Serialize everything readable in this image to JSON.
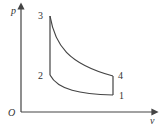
{
  "diagram": {
    "type": "p-v cycle diagram",
    "axes": {
      "y_label": "p",
      "x_label": "v",
      "origin_label": "O"
    },
    "points": [
      {
        "id": "1",
        "label": "1"
      },
      {
        "id": "2",
        "label": "2"
      },
      {
        "id": "3",
        "label": "3"
      },
      {
        "id": "4",
        "label": "4"
      }
    ],
    "processes": [
      {
        "from": "1",
        "to": "2",
        "kind": "curve"
      },
      {
        "from": "2",
        "to": "3",
        "kind": "vertical"
      },
      {
        "from": "3",
        "to": "4",
        "kind": "curve"
      },
      {
        "from": "4",
        "to": "1",
        "kind": "vertical"
      }
    ],
    "colors": {
      "line": "#444444",
      "text": "#333333"
    }
  }
}
